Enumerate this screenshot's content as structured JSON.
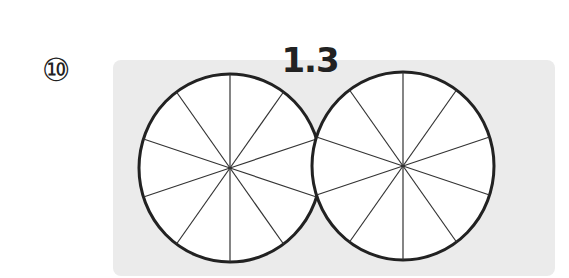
{
  "problem": {
    "number_label": "⑩",
    "value_label": "1.3"
  },
  "figure": {
    "shapes": [
      {
        "name": "circle-1",
        "divisions": 10,
        "shaded": 0
      },
      {
        "name": "circle-2",
        "divisions": 10,
        "shaded": 0
      }
    ],
    "colors": {
      "panel_bg": "#ebebeb",
      "circle_fill": "#ffffff",
      "stroke": "#222222"
    }
  }
}
